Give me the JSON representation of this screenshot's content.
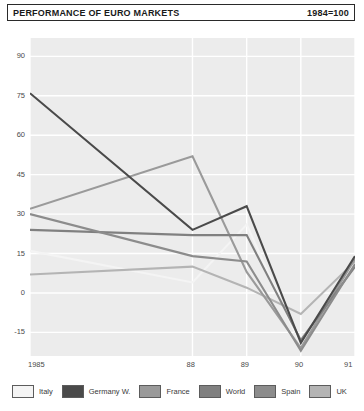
{
  "header": {
    "title": "PERFORMANCE OF EURO MARKETS",
    "index_note": "1984=100"
  },
  "chart_data": {
    "type": "line",
    "title": "PERFORMANCE OF EURO MARKETS",
    "subtitle": "1984=100",
    "xlabel": "",
    "ylabel": "",
    "x": [
      1985,
      1988,
      1989,
      1990,
      1991
    ],
    "xtick_labels": [
      "1985",
      "88",
      "89",
      "90",
      "91"
    ],
    "ytick_labels": [
      "90",
      "75",
      "60",
      "45",
      "30",
      "15",
      "0",
      "-15"
    ],
    "yticks": [
      90,
      75,
      60,
      45,
      30,
      15,
      0,
      -15
    ],
    "ylim": [
      -24,
      97
    ],
    "xlim": [
      1985,
      1991
    ],
    "grid": true,
    "grid_color": "#ffffff",
    "plot_background": "#ececec",
    "legend_position": "bottom",
    "series": [
      {
        "name": "Italy",
        "color": "#f4f4f4",
        "values": [
          16,
          4,
          26,
          -20,
          12
        ]
      },
      {
        "name": "Germany W.",
        "color": "#4a4a4a",
        "values": [
          76,
          24,
          33,
          -19,
          14
        ]
      },
      {
        "name": "France",
        "color": "#9a9a9a",
        "values": [
          32,
          52,
          8,
          -21,
          13
        ]
      },
      {
        "name": "World",
        "color": "#808080",
        "values": [
          24,
          22,
          22,
          -18,
          10
        ]
      },
      {
        "name": "Spain",
        "color": "#8c8c8c",
        "values": [
          30,
          14,
          12,
          -22,
          11
        ]
      },
      {
        "name": "UK",
        "color": "#b4b4b4",
        "values": [
          7,
          10,
          2,
          -8,
          12
        ]
      }
    ]
  },
  "legend": {
    "items": [
      {
        "label": "Italy",
        "color": "#f4f4f4"
      },
      {
        "label": "Germany W.",
        "color": "#4a4a4a"
      },
      {
        "label": "France",
        "color": "#9a9a9a"
      },
      {
        "label": "World",
        "color": "#808080"
      },
      {
        "label": "Spain",
        "color": "#8c8c8c"
      },
      {
        "label": "UK",
        "color": "#b4b4b4"
      }
    ]
  }
}
